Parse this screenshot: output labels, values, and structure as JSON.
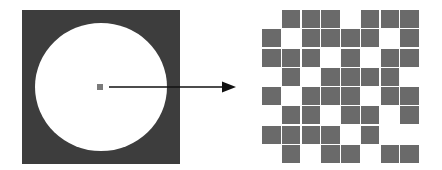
{
  "figure": {
    "left_panel": {
      "description": "dark square with white circle and single center pixel",
      "square_color": "#3d3d3d",
      "circle_color": "#ffffff",
      "center_pixel_color": "#7a7a7a"
    },
    "arrow": {
      "color": "#111111",
      "direction": "right"
    },
    "right_panel": {
      "description": "8x8 binary pixel grid",
      "rows": 8,
      "cols": 8,
      "fill_color": "#6a6a6a",
      "pattern": [
        [
          0,
          1,
          1,
          1,
          0,
          1,
          1,
          1
        ],
        [
          1,
          0,
          1,
          1,
          1,
          1,
          0,
          1
        ],
        [
          1,
          1,
          1,
          0,
          1,
          0,
          1,
          1
        ],
        [
          0,
          1,
          0,
          1,
          1,
          1,
          1,
          0
        ],
        [
          1,
          0,
          1,
          1,
          1,
          0,
          1,
          1
        ],
        [
          0,
          1,
          1,
          0,
          1,
          1,
          0,
          1
        ],
        [
          1,
          1,
          1,
          1,
          0,
          1,
          0,
          0
        ],
        [
          0,
          1,
          0,
          1,
          1,
          0,
          1,
          1
        ]
      ]
    }
  }
}
